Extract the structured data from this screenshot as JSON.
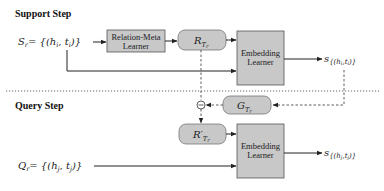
{
  "support_step": {
    "title": "Support Step",
    "input_set": {
      "lhs": "S",
      "lhs_sub": "r",
      "rhs": "= {(h",
      "i1": "i",
      "comma": ", t",
      "i2": "i",
      "close": ")}"
    },
    "relation_meta_learner": {
      "line1": "Relation-Meta",
      "line2": "Learner"
    },
    "relation_meta": {
      "symbol": "R",
      "sub": "T",
      "subsub": "r"
    },
    "embedding_learner": {
      "line1": "Embedding",
      "line2": "Learner"
    },
    "output_score": {
      "s": "s",
      "set_open": "{(h",
      "i1": "i",
      "comma": ",t",
      "i2": "i",
      "set_close": ")}"
    }
  },
  "query_step": {
    "title": "Query Step",
    "input_set": {
      "lhs": "Q",
      "lhs_sub": "r",
      "rhs": "= {(h",
      "j1": "j",
      "comma": ", t",
      "j2": "j",
      "close": ")}"
    },
    "gradient": {
      "symbol": "G",
      "sub": "T",
      "subsub": "r"
    },
    "minus_op": "−",
    "updated_relation_meta": {
      "symbol": "R′",
      "sub": "T",
      "subsub": "r"
    },
    "embedding_learner": {
      "line1": "Embedding",
      "line2": "Learner"
    },
    "output_score": {
      "s": "s",
      "set_open": "{(h",
      "j1": "j",
      "comma": ",t",
      "j2": "j",
      "set_close": ")}"
    }
  },
  "colors": {
    "box_fill": "#c8c8c8",
    "box_stroke": "#555555",
    "arrow": "#222222",
    "separator": "#555555"
  }
}
